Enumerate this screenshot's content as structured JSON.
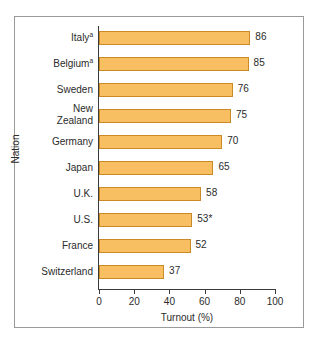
{
  "figure": {
    "frame_border_color": "#9a9a9a",
    "background": "#ffffff"
  },
  "chart_data": {
    "type": "bar",
    "orientation": "horizontal",
    "title": "",
    "xlabel": "Turnout (%)",
    "ylabel": "Nation",
    "xlim": [
      0,
      100
    ],
    "xticks": [
      0,
      20,
      40,
      60,
      80,
      100
    ],
    "xticklabels": [
      "0",
      "20",
      "40",
      "60",
      "80",
      "100"
    ],
    "grid": false,
    "legend": null,
    "bar_color": "#f7bf62",
    "bar_edge_color": "#c98a28",
    "categories": [
      "Italy",
      "Belgium",
      "Sweden",
      "New Zealand",
      "Germany",
      "Japan",
      "U.K.",
      "U.S.",
      "France",
      "Switzerland"
    ],
    "category_labels": [
      "Italy",
      "Belgium",
      "Sweden",
      "New\nZealand",
      "Germany",
      "Japan",
      "U.K.",
      "U.S.",
      "France",
      "Switzerland"
    ],
    "category_footnote_marks": [
      "a",
      "a",
      "",
      "",
      "",
      "",
      "",
      "",
      "",
      ""
    ],
    "values": [
      86,
      85,
      76,
      75,
      70,
      65,
      58,
      53,
      52,
      37
    ],
    "data_labels": [
      "86",
      "85",
      "76",
      "75",
      "70",
      "65",
      "58",
      "53*",
      "52",
      "37"
    ]
  }
}
